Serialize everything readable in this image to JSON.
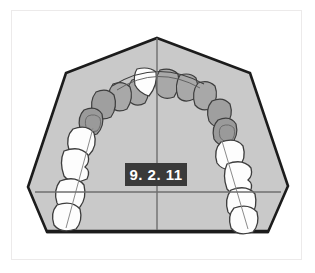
{
  "figure": {
    "view": "occlusal",
    "arch": "maxillary"
  },
  "label": {
    "text": "9. 2. 11",
    "background_color": "#3a3a3a",
    "text_color": "#ffffff"
  },
  "colors": {
    "page_background": "#ffffff",
    "frame_border": "#eceaea",
    "cast_fill": "#c9c9c9",
    "cast_outline": "#1c1c1c",
    "tooth_white_fill": "#fdfdfd",
    "tooth_shaded_fill": "#a8a8a8",
    "tooth_shaded_dark_fill": "#9a9a9a",
    "tooth_outline": "#3d3d3d",
    "reference_line": "#6e6e6e"
  },
  "reference_lines": {
    "midline": {
      "name": "vertical-midline",
      "x": 157,
      "y_start": 38,
      "y_end": 230
    },
    "transverse": {
      "name": "horizontal-reference-line",
      "y": 192,
      "x_start": 35,
      "x_end": 281
    }
  },
  "cast_outline_points": "157,38 250,73 288,186 268,232 47,232 28,187 66,73",
  "teeth": {
    "shaded_count": 10,
    "white_count": 8,
    "upper_right_quadrant": [
      {
        "name": "central-incisor",
        "shade": "white"
      },
      {
        "name": "lateral-incisor",
        "shade": "shaded"
      },
      {
        "name": "canine",
        "shade": "shaded"
      },
      {
        "name": "first-premolar",
        "shade": "shaded"
      },
      {
        "name": "second-premolar",
        "shade": "shaded"
      },
      {
        "name": "first-molar",
        "shade": "white"
      },
      {
        "name": "second-molar",
        "shade": "white"
      },
      {
        "name": "third-molar",
        "shade": "white"
      }
    ],
    "upper_left_quadrant": [
      {
        "name": "central-incisor",
        "shade": "shaded"
      },
      {
        "name": "lateral-incisor",
        "shade": "shaded"
      },
      {
        "name": "canine",
        "shade": "shaded"
      },
      {
        "name": "first-premolar",
        "shade": "shaded"
      },
      {
        "name": "second-premolar",
        "shade": "shaded"
      },
      {
        "name": "first-molar",
        "shade": "white"
      },
      {
        "name": "second-molar",
        "shade": "white"
      },
      {
        "name": "third-molar",
        "shade": "white"
      }
    ]
  }
}
